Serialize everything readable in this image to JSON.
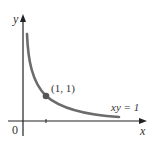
{
  "diagram": {
    "axes": {
      "x_label": "x",
      "y_label": "y",
      "origin_label": "0"
    },
    "curve": {
      "equation_label": "xy = 1",
      "color": "#6b6b6b"
    },
    "point": {
      "label": "(1, 1)",
      "x": 1,
      "y": 1,
      "color": "#555555"
    },
    "axis_color": "#222222"
  }
}
